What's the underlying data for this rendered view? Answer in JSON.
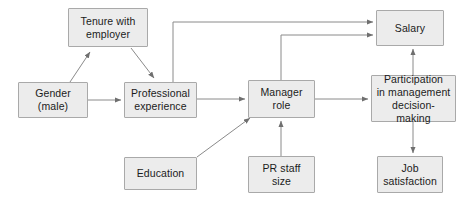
{
  "diagram": {
    "type": "path-diagram",
    "canvas": {
      "width": 464,
      "height": 203
    },
    "style": {
      "node_fill": "#ececec",
      "node_border": "#a9a9a9",
      "edge_color": "#808080",
      "text_color": "#1b1b1b",
      "background": "#ffffff"
    },
    "nodes": [
      {
        "id": "tenure",
        "label": "Tenure with\nemployer",
        "x": 68,
        "y": 8,
        "w": 80,
        "h": 39
      },
      {
        "id": "gender",
        "label": "Gender\n(male)",
        "x": 18,
        "y": 82,
        "w": 70,
        "h": 36
      },
      {
        "id": "professional",
        "label": "Professional\nexperience",
        "x": 124,
        "y": 82,
        "w": 73,
        "h": 36
      },
      {
        "id": "education",
        "label": "Education",
        "x": 124,
        "y": 157,
        "w": 73,
        "h": 33
      },
      {
        "id": "manager",
        "label": "Manager\nrole",
        "x": 248,
        "y": 80,
        "w": 67,
        "h": 38
      },
      {
        "id": "prstaff",
        "label": "PR staff\nsize",
        "x": 248,
        "y": 156,
        "w": 67,
        "h": 37
      },
      {
        "id": "salary",
        "label": "Salary",
        "x": 376,
        "y": 10,
        "w": 68,
        "h": 36
      },
      {
        "id": "participation",
        "label": "Participation\nin management\ndecision-making",
        "x": 371,
        "y": 75,
        "w": 85,
        "h": 47
      },
      {
        "id": "jobsat",
        "label": "Job\nsatisfaction",
        "x": 377,
        "y": 156,
        "w": 66,
        "h": 37
      }
    ],
    "edges": [
      {
        "from": "gender",
        "to": "tenure",
        "style": "diagonal"
      },
      {
        "from": "gender",
        "to": "professional",
        "style": "straight"
      },
      {
        "from": "tenure",
        "to": "professional",
        "style": "diagonal"
      },
      {
        "from": "professional",
        "to": "manager",
        "style": "straight"
      },
      {
        "from": "professional",
        "to": "salary",
        "style": "orthogonal"
      },
      {
        "from": "education",
        "to": "manager",
        "style": "diagonal"
      },
      {
        "from": "prstaff",
        "to": "manager",
        "style": "straight"
      },
      {
        "from": "manager",
        "to": "salary",
        "style": "orthogonal"
      },
      {
        "from": "manager",
        "to": "participation",
        "style": "straight"
      },
      {
        "from": "participation",
        "to": "salary",
        "style": "straight"
      },
      {
        "from": "participation",
        "to": "jobsat",
        "style": "straight"
      }
    ]
  }
}
